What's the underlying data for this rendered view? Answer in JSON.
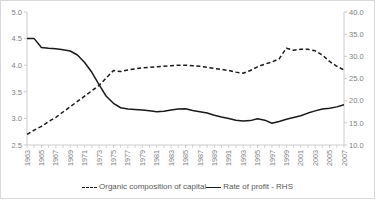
{
  "chart_data": {
    "type": "line",
    "title": "",
    "xlabel": "",
    "ylabel": "",
    "grid": false,
    "legend_position": "bottom",
    "x": [
      1963,
      1964,
      1965,
      1966,
      1967,
      1968,
      1969,
      1970,
      1971,
      1972,
      1973,
      1974,
      1975,
      1976,
      1977,
      1978,
      1979,
      1980,
      1981,
      1982,
      1983,
      1984,
      1985,
      1986,
      1987,
      1988,
      1989,
      1990,
      1991,
      1992,
      1993,
      1994,
      1995,
      1996,
      1997,
      1998,
      1999,
      2000,
      2001,
      2002,
      2003,
      2004,
      2005,
      2006,
      2007
    ],
    "x_tick_labels": [
      "1963",
      "1965",
      "1967",
      "1969",
      "1971",
      "1973",
      "1975",
      "1977",
      "1979",
      "1981",
      "1983",
      "1985",
      "1987",
      "1989",
      "1991",
      "1993",
      "1995",
      "1997",
      "1999",
      "2001",
      "2003",
      "2005",
      "2007"
    ],
    "left_axis": {
      "label": "Organic composition of capital",
      "ylim": [
        2.5,
        5.0
      ],
      "ticks": [
        2.5,
        3.0,
        3.5,
        4.0,
        4.5,
        5.0
      ],
      "tick_labels": [
        "2.5",
        "3.0",
        "3.5",
        "4.0",
        "4.5",
        "5.0"
      ]
    },
    "right_axis": {
      "label": "Rate of profit - RHS",
      "ylim": [
        10.0,
        40.0
      ],
      "ticks": [
        10.0,
        15.0,
        20.0,
        25.0,
        30.0,
        35.0,
        40.0
      ],
      "tick_labels": [
        "10.0",
        "15.0",
        "20.0",
        "25.0",
        "30.0",
        "35.0",
        "40.0"
      ]
    },
    "series": [
      {
        "name": "Organic composition of capital",
        "axis": "left",
        "style": "dashed",
        "color": "#1a1a1a",
        "values": [
          2.7,
          2.78,
          2.85,
          2.94,
          3.02,
          3.12,
          3.22,
          3.32,
          3.42,
          3.52,
          3.62,
          3.76,
          3.9,
          3.88,
          3.91,
          3.93,
          3.95,
          3.96,
          3.97,
          3.98,
          3.99,
          4.0,
          4.0,
          3.99,
          3.98,
          3.96,
          3.94,
          3.92,
          3.9,
          3.87,
          3.85,
          3.9,
          3.97,
          4.02,
          4.06,
          4.12,
          4.32,
          4.28,
          4.3,
          4.3,
          4.27,
          4.19,
          4.07,
          3.98,
          3.91
        ]
      },
      {
        "name": "Rate of profit - RHS",
        "axis": "right",
        "style": "solid",
        "color": "#1a1a1a",
        "values": [
          34.0,
          34.0,
          32.0,
          31.8,
          31.7,
          31.5,
          31.2,
          30.3,
          28.6,
          26.4,
          23.6,
          21.0,
          19.4,
          18.4,
          18.1,
          18.0,
          17.9,
          17.7,
          17.5,
          17.6,
          17.9,
          18.1,
          18.2,
          17.8,
          17.5,
          17.2,
          16.7,
          16.3,
          16.0,
          15.6,
          15.4,
          15.5,
          15.9,
          15.6,
          14.9,
          15.3,
          15.8,
          16.2,
          16.6,
          17.2,
          17.7,
          18.1,
          18.3,
          18.6,
          19.1
        ]
      }
    ]
  },
  "legend": {
    "entries": [
      {
        "label": "Organic composition of capital",
        "style": "dashed"
      },
      {
        "label": "Rate of profit - RHS",
        "style": "solid"
      }
    ]
  }
}
